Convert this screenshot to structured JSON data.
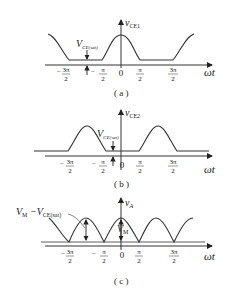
{
  "panels": [
    {
      "id": "a",
      "caption": "( a )",
      "y_label": "v",
      "y_label_sub": "CE1",
      "x_label": "ωt",
      "annotation": "V",
      "annotation_sub": "CE(sat)",
      "ticks": [
        {
          "num": "3π",
          "den": "2",
          "neg": true
        },
        {
          "num": "π",
          "den": "2",
          "neg": true
        },
        {
          "num": "0",
          "den": "",
          "neg": false
        },
        {
          "num": "π",
          "den": "2",
          "neg": false
        },
        {
          "num": "3π",
          "den": "2",
          "neg": false
        }
      ]
    },
    {
      "id": "b",
      "caption": "( b )",
      "y_label": "v",
      "y_label_sub": "CE2",
      "x_label": "ωt",
      "annotation": "V",
      "annotation_sub": "CE(sat)",
      "ticks": [
        {
          "num": "3π",
          "den": "2",
          "neg": true
        },
        {
          "num": "π",
          "den": "2",
          "neg": true
        },
        {
          "num": "0",
          "den": "",
          "neg": false
        },
        {
          "num": "π",
          "den": "2",
          "neg": false
        },
        {
          "num": "3π",
          "den": "2",
          "neg": false
        }
      ]
    },
    {
      "id": "c",
      "caption": "( c )",
      "y_label": "v",
      "y_label_sub": "A",
      "x_label": "ωt",
      "annotation_left": "V",
      "annotation_left_sub": "M",
      "annotation_left_rest": " −V",
      "annotation_left_rest_sub": "CE(sat)",
      "annotation_center": "V",
      "annotation_center_sub": "M",
      "ticks": [
        {
          "num": "3π",
          "den": "2",
          "neg": true
        },
        {
          "num": "π",
          "den": "2",
          "neg": true
        },
        {
          "num": "0",
          "den": "",
          "neg": false
        },
        {
          "num": "π",
          "den": "2",
          "neg": false
        },
        {
          "num": "3π",
          "den": "2",
          "neg": false
        }
      ]
    }
  ]
}
